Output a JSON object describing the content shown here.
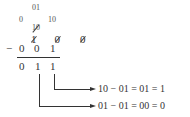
{
  "diagram": {
    "borrow_row_top": "01",
    "borrow_row": [
      "0",
      "10",
      "10"
    ],
    "borrow_row_struck": [
      false,
      true,
      false
    ],
    "minuend": [
      "1",
      "0",
      "0"
    ],
    "minuend_struck": [
      true,
      true,
      true
    ],
    "operator": "−",
    "subtrahend": [
      "0",
      "0",
      "1"
    ],
    "result": [
      "0",
      "1",
      "1"
    ],
    "explanations": [
      {
        "text": "10 − 01 = 01 = 1",
        "from_column": 2
      },
      {
        "text": "01 − 01 = 00 = 0",
        "from_column": 1
      }
    ]
  }
}
